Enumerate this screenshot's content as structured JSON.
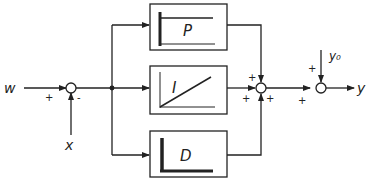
{
  "diagram": {
    "signals": {
      "input_w": "w",
      "feedback_x": "x",
      "output_y": "y",
      "disturbance_y0": "y₀"
    },
    "blocks": [
      {
        "id": "P",
        "label": "P",
        "response": "step"
      },
      {
        "id": "I",
        "label": "I",
        "response": "ramp"
      },
      {
        "id": "D",
        "label": "D",
        "response": "impulse"
      }
    ],
    "summing_junctions": [
      {
        "id": "error",
        "signs": {
          "w": "+",
          "x": "-"
        }
      },
      {
        "id": "sum_pid",
        "signs": {
          "P": "+",
          "I": "+",
          "D": "+"
        }
      },
      {
        "id": "sum_out",
        "signs": {
          "pid": "+",
          "y0": "+"
        }
      }
    ],
    "colors": {
      "line": "#222222",
      "background": "#ffffff"
    }
  }
}
